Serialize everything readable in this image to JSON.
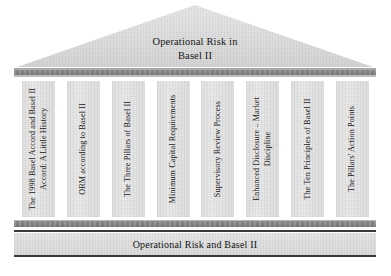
{
  "diagram": {
    "type": "greek-temple",
    "pediment": {
      "title_line1": "Operational Risk in",
      "title_line2": "Basel II"
    },
    "columns": [
      {
        "label": "The 1998 Basel Accord and Basel II Accord: A Little History"
      },
      {
        "label": "ORM according to Basel II"
      },
      {
        "label": "The Three Pillars of Basel II"
      },
      {
        "label": "Minimum Capital Requirements"
      },
      {
        "label": "Supervisory Review Process"
      },
      {
        "label": "Enhanced Disclosure – Market Discipline"
      },
      {
        "label": "The Ten Principles of Basel II"
      },
      {
        "label": "The Pillars' Action Points"
      }
    ],
    "base": {
      "label": "Operational Risk and Basel II"
    },
    "colors": {
      "stone_fill": "#e4e4e4",
      "band_dark": "#848484",
      "rule": "#3a3a3a",
      "text": "#151515",
      "background": "#ffffff"
    }
  }
}
